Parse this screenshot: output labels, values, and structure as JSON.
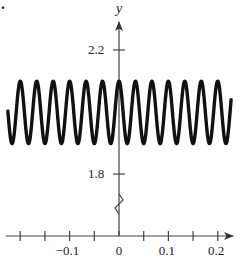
{
  "problem_label": ".",
  "chart_data": {
    "type": "line",
    "title": "",
    "xlabel": "",
    "ylabel": "y",
    "function": "y = 2 + 0.1 cos(60πx)",
    "series": [
      {
        "name": "curve",
        "x_range": [
          -0.225,
          0.227
        ],
        "midline": 2.0,
        "amplitude": 0.1,
        "period": 0.0333,
        "peaks_visible": 13
      }
    ],
    "x_ticks": [
      -0.2,
      -0.15,
      -0.1,
      -0.05,
      0,
      0.05,
      0.1,
      0.15,
      0.2
    ],
    "x_tick_labels": [
      {
        "value": -0.1,
        "label": "−0.1"
      },
      {
        "value": 0,
        "label": "0"
      },
      {
        "value": 0.1,
        "label": "0.1"
      },
      {
        "value": 0.2,
        "label": "0.2"
      }
    ],
    "y_tick_labels": [
      {
        "value": 2.2,
        "label": "2.2"
      },
      {
        "value": 1.8,
        "label": "1.8"
      }
    ],
    "xlim": [
      -0.24,
      0.24
    ],
    "ylim": [
      1.8,
      2.2
    ],
    "y_axis_break": true,
    "grid": false,
    "legend": "none"
  }
}
